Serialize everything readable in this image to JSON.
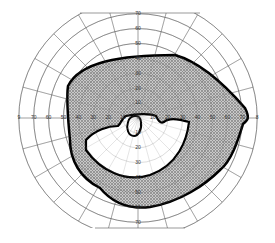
{
  "diagram": {
    "type": "visual-field-perimetry-chart",
    "center": [
      138,
      118
    ],
    "px_per_10deg": 14.9,
    "rings_deg": [
      10,
      20,
      30,
      40,
      50,
      60,
      70,
      80
    ],
    "spoke_step_deg": 15,
    "ring_labels": {
      "top": [
        "10",
        "20",
        "30",
        "40",
        "50",
        "60",
        "70"
      ],
      "bottom": [
        "10",
        "20",
        "30",
        "40",
        "50",
        "60",
        "70"
      ],
      "left": [
        "10",
        "20",
        "30",
        "40",
        "50",
        "60",
        "70",
        "9"
      ],
      "right": [
        "10",
        "20",
        "30",
        "40",
        "50",
        "60",
        "70",
        "8"
      ]
    },
    "regions": [
      {
        "name": "shaded-scotoma",
        "fill": "hatched-gray",
        "outline": "#000"
      },
      {
        "name": "spared-inferior-arc",
        "fill": "#ffffff"
      },
      {
        "name": "central-island",
        "fill": "#ffffff"
      }
    ],
    "colors": {
      "grid": "#555555",
      "outline": "#000000",
      "shade": "#9a9a9a",
      "background": "#ffffff"
    }
  }
}
